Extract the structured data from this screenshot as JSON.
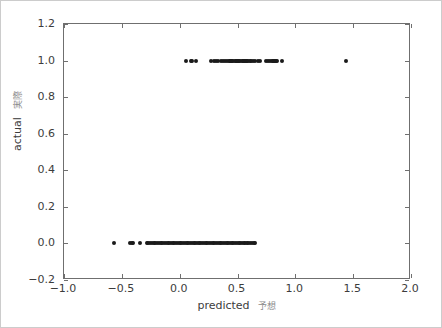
{
  "figure": {
    "background_color": "#ffffff",
    "border_color": "#cccccc",
    "axes_edge_color": "#6f6f6f",
    "marker_color": "#1a1a1a",
    "tick_label_color": "#3c3c3c"
  },
  "axis": {
    "xlabel_en": "predicted",
    "xlabel_jp": "予想",
    "ylabel_en": "actual",
    "ylabel_jp": "実際",
    "xticklabels": [
      "−1.0",
      "−0.5",
      "0.0",
      "0.5",
      "1.0",
      "1.5",
      "2.0"
    ],
    "yticklabels": [
      "−0.2",
      "0.0",
      "0.2",
      "0.4",
      "0.6",
      "0.8",
      "1.0",
      "1.2"
    ]
  },
  "chart_data": {
    "type": "scatter",
    "title": "",
    "xlabel": "predicted 予想",
    "ylabel": "actual 実際",
    "xlim": [
      -1.0,
      2.0
    ],
    "ylim": [
      -0.2,
      1.2
    ],
    "xticks": [
      -1.0,
      -0.5,
      0.0,
      0.5,
      1.0,
      1.5,
      2.0
    ],
    "yticks": [
      -0.2,
      0.0,
      0.2,
      0.4,
      0.6,
      0.8,
      1.0,
      1.2
    ],
    "grid": false,
    "legend": null,
    "marker": "circle",
    "marker_size": 4,
    "series": [
      {
        "name": "actual vs predicted",
        "x": [
          0.055,
          0.095,
          0.105,
          0.145,
          0.275,
          0.295,
          0.315,
          0.335,
          0.355,
          0.375,
          0.395,
          0.405,
          0.425,
          0.435,
          0.445,
          0.455,
          0.465,
          0.475,
          0.485,
          0.495,
          0.505,
          0.515,
          0.525,
          0.535,
          0.545,
          0.555,
          0.565,
          0.575,
          0.585,
          0.595,
          0.605,
          0.615,
          0.635,
          0.655,
          0.675,
          0.695,
          0.745,
          0.765,
          0.785,
          0.795,
          0.805,
          0.815,
          0.825,
          0.835,
          0.845,
          0.885,
          1.44,
          -0.57,
          -0.43,
          -0.415,
          -0.4,
          -0.345,
          -0.285,
          -0.27,
          -0.255,
          -0.24,
          -0.225,
          -0.21,
          -0.195,
          -0.18,
          -0.165,
          -0.15,
          -0.135,
          -0.12,
          -0.105,
          -0.09,
          -0.075,
          -0.06,
          -0.045,
          -0.03,
          -0.015,
          0.0,
          0.015,
          0.03,
          0.045,
          0.06,
          0.075,
          0.09,
          0.105,
          0.12,
          0.135,
          0.15,
          0.165,
          0.18,
          0.195,
          0.21,
          0.225,
          0.24,
          0.255,
          0.27,
          0.285,
          0.3,
          0.315,
          0.33,
          0.345,
          0.36,
          0.375,
          0.39,
          0.405,
          0.42,
          0.435,
          0.45,
          0.465,
          0.48,
          0.495,
          0.51,
          0.525,
          0.54,
          0.555,
          0.565,
          0.58,
          0.595,
          0.61,
          0.625,
          0.64,
          0.65
        ],
        "y": [
          1.0,
          1.0,
          1.0,
          1.0,
          1.0,
          1.0,
          1.0,
          1.0,
          1.0,
          1.0,
          1.0,
          1.0,
          1.0,
          1.0,
          1.0,
          1.0,
          1.0,
          1.0,
          1.0,
          1.0,
          1.0,
          1.0,
          1.0,
          1.0,
          1.0,
          1.0,
          1.0,
          1.0,
          1.0,
          1.0,
          1.0,
          1.0,
          1.0,
          1.0,
          1.0,
          1.0,
          1.0,
          1.0,
          1.0,
          1.0,
          1.0,
          1.0,
          1.0,
          1.0,
          1.0,
          1.0,
          1.0,
          0.0,
          0.0,
          0.0,
          0.0,
          0.0,
          0.0,
          0.0,
          0.0,
          0.0,
          0.0,
          0.0,
          0.0,
          0.0,
          0.0,
          0.0,
          0.0,
          0.0,
          0.0,
          0.0,
          0.0,
          0.0,
          0.0,
          0.0,
          0.0,
          0.0,
          0.0,
          0.0,
          0.0,
          0.0,
          0.0,
          0.0,
          0.0,
          0.0,
          0.0,
          0.0,
          0.0,
          0.0,
          0.0,
          0.0,
          0.0,
          0.0,
          0.0,
          0.0,
          0.0,
          0.0,
          0.0,
          0.0,
          0.0,
          0.0,
          0.0,
          0.0,
          0.0,
          0.0,
          0.0,
          0.0,
          0.0,
          0.0,
          0.0,
          0.0,
          0.0,
          0.0,
          0.0,
          0.0,
          0.0,
          0.0,
          0.0,
          0.0,
          0.0,
          0.0
        ]
      }
    ]
  }
}
